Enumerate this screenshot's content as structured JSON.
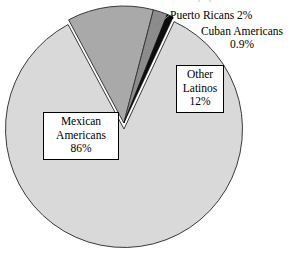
{
  "figure": {
    "title_remnant": "Latino population",
    "background_color": "#ffffff"
  },
  "chart_data": {
    "type": "pie",
    "title": "",
    "xlabel": "",
    "ylabel": "",
    "legend_position": "none",
    "grid": false,
    "categories": [
      "Mexican Americans",
      "Other Latinos",
      "Puerto Ricans",
      "Cuban Americans"
    ],
    "values": [
      86,
      12,
      2,
      0.9
    ],
    "value_labels": [
      "86%",
      "12%",
      "2%",
      "0.9%"
    ],
    "colors": [
      "#d9d9d9",
      "#a9a9a9",
      "#8c8c8c",
      "#0d0d0d"
    ],
    "slice_border_color": "#3a3a3a",
    "exploded": [
      "Other Latinos",
      "Puerto Ricans",
      "Cuban Americans"
    ],
    "start_angle_deg": 295,
    "direction": "clockwise"
  },
  "labels": {
    "puerto_ricans": {
      "name": "Puerto Ricans",
      "text": "Puerto Ricans 2%",
      "value": "2%"
    },
    "cuban_americans": {
      "name": "Cuban Americans",
      "line1": "Cuban Americans",
      "line2": "0.9%",
      "value": "0.9%"
    },
    "other_latinos": {
      "name": "Other Latinos",
      "line1": "Other",
      "line2": "Latinos",
      "line3": "12%",
      "value": "12%"
    },
    "mexican_americans": {
      "name": "Mexican Americans",
      "line1": "Mexican",
      "line2": "Americans",
      "line3": "86%",
      "value": "86%"
    }
  }
}
